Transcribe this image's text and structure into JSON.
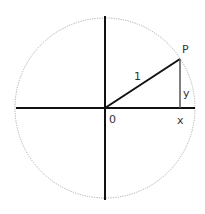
{
  "diagram": {
    "labels": {
      "point": "P",
      "radius": "1",
      "origin": "0",
      "x": "x",
      "y": "y"
    },
    "colors": {
      "axis": "#111111",
      "circle": "#999999",
      "radius": "#111111",
      "y_segment": "#555555",
      "text": "#333333"
    }
  }
}
